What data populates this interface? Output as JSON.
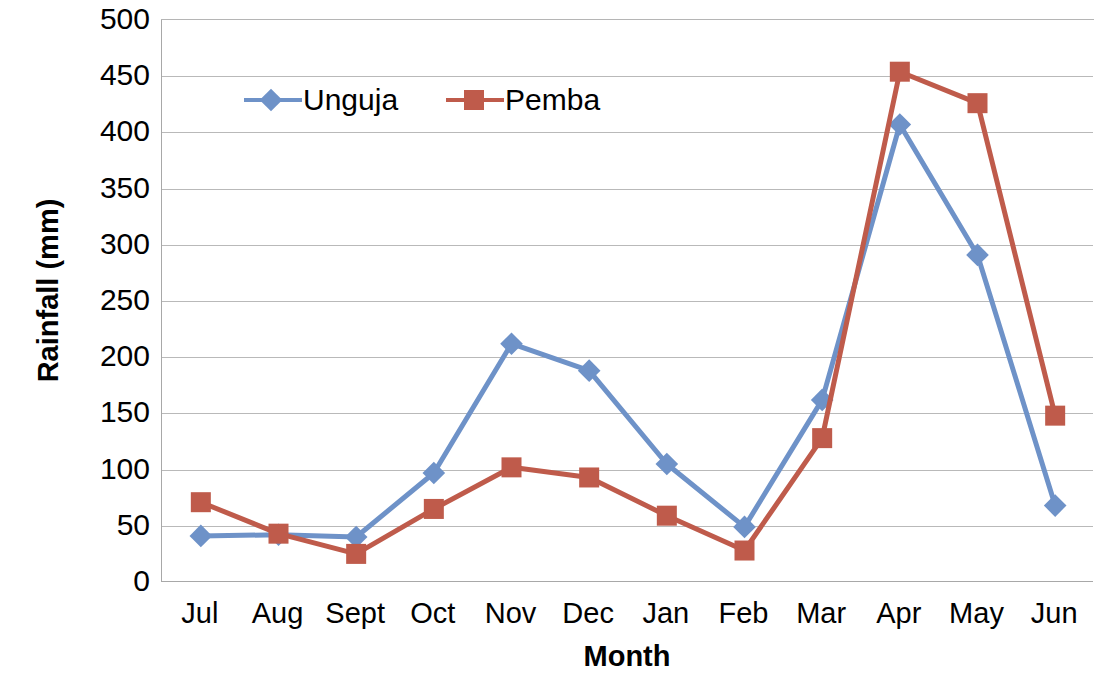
{
  "chart_data": {
    "type": "line",
    "title": "",
    "xlabel": "Month",
    "ylabel": "Rainfall (mm)",
    "categories": [
      "Jul",
      "Aug",
      "Sept",
      "Oct",
      "Nov",
      "Dec",
      "Jan",
      "Feb",
      "Mar",
      "Apr",
      "May",
      "Jun"
    ],
    "ylim": [
      0,
      500
    ],
    "ytick_labels": [
      "0",
      "50",
      "100",
      "150",
      "200",
      "250",
      "300",
      "350",
      "400",
      "450",
      "500"
    ],
    "ytick_values": [
      0,
      50,
      100,
      150,
      200,
      250,
      300,
      350,
      400,
      450,
      500
    ],
    "grid": "horizontal",
    "legend_position": "upper-left-inside",
    "series": [
      {
        "name": "Unguja",
        "color": "#6E92C8",
        "marker": "diamond",
        "values": [
          41,
          42,
          40,
          97,
          212,
          188,
          105,
          49,
          162,
          407,
          291,
          68
        ]
      },
      {
        "name": "Pemba",
        "color": "#BF5B4B",
        "marker": "square",
        "values": [
          71,
          43,
          25,
          65,
          102,
          93,
          59,
          28,
          128,
          454,
          426,
          148
        ]
      }
    ]
  },
  "axes": {
    "y_title": "Rainfall (mm)",
    "x_title": "Month"
  },
  "colors": {
    "unguja": "#6E92C8",
    "pemba": "#BF5B4B",
    "gridline": "#b9b9b9",
    "axis": "#a8a8a8",
    "text": "#000000"
  }
}
